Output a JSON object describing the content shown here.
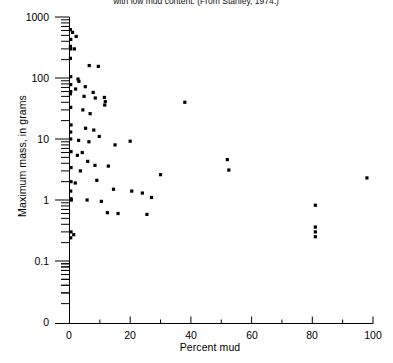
{
  "caption": "with low mud content. (From Stanley, 1974.)",
  "axes": {
    "x": {
      "label": "Percent mud",
      "min": 0,
      "max": 100,
      "major_ticks": [
        0,
        20,
        40,
        60,
        80,
        100
      ],
      "minor_ticks": [
        10,
        30,
        50,
        70,
        90
      ],
      "tick_labels": [
        "0",
        "20",
        "40",
        "60",
        "80",
        "100"
      ],
      "scale": "linear"
    },
    "y": {
      "label": "Maximum mass, in grams",
      "scale": "log",
      "min": 0.03,
      "max": 1000,
      "major_ticks": [
        1000,
        100,
        10,
        1,
        0.1
      ],
      "tick_labels": [
        "1000",
        "100",
        "10",
        "1",
        "0.1"
      ],
      "zero_label": "0"
    }
  },
  "chart_data": {
    "type": "scatter",
    "title": "",
    "xlabel": "Percent mud",
    "ylabel": "Maximum mass, in grams",
    "xlim": [
      0,
      100
    ],
    "ylim": [
      0.03,
      1000
    ],
    "yscale": "log",
    "xscale": "linear",
    "grid": false,
    "legend": null,
    "marker": "filled-square",
    "marker_color": "#000000",
    "n_points": 67,
    "points": [
      [
        0.3,
        620
      ],
      [
        1.0,
        560
      ],
      [
        0.4,
        430
      ],
      [
        2.2,
        480
      ],
      [
        0.3,
        330
      ],
      [
        1.6,
        300
      ],
      [
        0.4,
        300
      ],
      [
        0.3,
        210
      ],
      [
        6.5,
        160
      ],
      [
        9.5,
        155
      ],
      [
        0.4,
        105
      ],
      [
        2.8,
        96
      ],
      [
        3.1,
        88
      ],
      [
        0.4,
        78
      ],
      [
        5.2,
        72
      ],
      [
        2.0,
        66
      ],
      [
        0.4,
        60
      ],
      [
        7.8,
        58
      ],
      [
        0.3,
        55
      ],
      [
        4.8,
        50
      ],
      [
        8.5,
        47
      ],
      [
        11.5,
        48
      ],
      [
        11.8,
        41
      ],
      [
        11.6,
        36
      ],
      [
        38.0,
        40
      ],
      [
        0.4,
        33
      ],
      [
        4.4,
        30
      ],
      [
        6.8,
        26
      ],
      [
        0.5,
        17
      ],
      [
        5.3,
        15
      ],
      [
        8.0,
        14
      ],
      [
        0.4,
        13
      ],
      [
        9.8,
        11
      ],
      [
        0.4,
        10
      ],
      [
        3.0,
        9.5
      ],
      [
        6.4,
        9.0
      ],
      [
        20.0,
        9.2
      ],
      [
        15.0,
        8.0
      ],
      [
        0.5,
        6.2
      ],
      [
        4.2,
        6.0
      ],
      [
        2.6,
        5.4
      ],
      [
        52.0,
        4.6
      ],
      [
        6.0,
        4.3
      ],
      [
        8.4,
        3.7
      ],
      [
        0.5,
        3.4
      ],
      [
        12.8,
        3.6
      ],
      [
        3.6,
        3.0
      ],
      [
        52.5,
        3.1
      ],
      [
        30.0,
        2.6
      ],
      [
        98.0,
        2.3
      ],
      [
        0.5,
        2.0
      ],
      [
        9.0,
        2.1
      ],
      [
        1.9,
        1.9
      ],
      [
        0.4,
        1.4
      ],
      [
        14.5,
        1.5
      ],
      [
        20.5,
        1.4
      ],
      [
        24.0,
        1.3
      ],
      [
        0.5,
        1.05
      ],
      [
        0.6,
        1.0
      ],
      [
        5.8,
        1.0
      ],
      [
        10.5,
        0.95
      ],
      [
        27.0,
        1.1
      ],
      [
        81.0,
        0.82
      ],
      [
        12.5,
        0.62
      ],
      [
        16.0,
        0.6
      ],
      [
        25.5,
        0.58
      ],
      [
        0.5,
        0.3
      ],
      [
        1.4,
        0.27
      ],
      [
        0.4,
        0.24
      ],
      [
        81.0,
        0.36
      ],
      [
        81.0,
        0.3
      ],
      [
        81.0,
        0.25
      ]
    ]
  }
}
